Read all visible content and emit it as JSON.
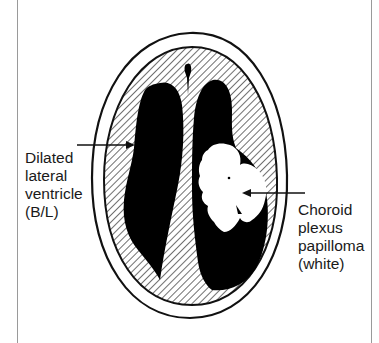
{
  "diagram": {
    "labels": {
      "left": {
        "lines": [
          "Dilated",
          "lateral",
          "ventricle",
          "(B/L)"
        ]
      },
      "right": {
        "lines": [
          "Choroid",
          "plexus",
          "papilloma",
          "(white)"
        ]
      }
    },
    "colors": {
      "outline": "#111111",
      "ventricle_fill": "#000000",
      "tumor_fill": "#ffffff",
      "hatch": "#222222",
      "frame": "#9a9a9a",
      "background": "#ffffff"
    }
  }
}
